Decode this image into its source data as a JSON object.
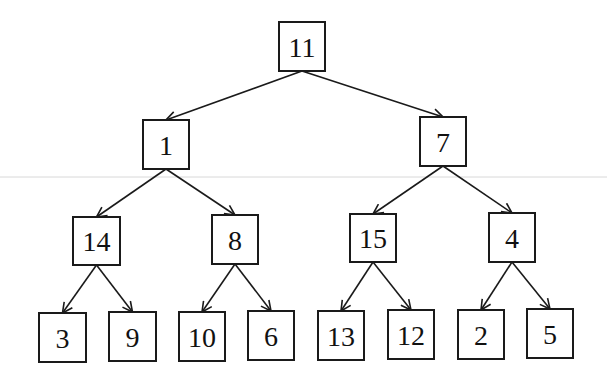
{
  "diagram": {
    "type": "binary-tree",
    "colors": {
      "stroke": "#1a1a1a",
      "fill": "#ffffff",
      "text": "#111111",
      "rule": "#d8d8d8"
    },
    "rule_y": 177,
    "nodes": [
      {
        "id": "n11",
        "label": "11",
        "x": 279,
        "y": 22,
        "w": 46,
        "h": 49
      },
      {
        "id": "n1",
        "label": "1",
        "x": 143,
        "y": 120,
        "w": 46,
        "h": 49
      },
      {
        "id": "n7",
        "label": "7",
        "x": 420,
        "y": 117,
        "w": 46,
        "h": 49
      },
      {
        "id": "n14",
        "label": "14",
        "x": 73,
        "y": 217,
        "w": 47,
        "h": 48
      },
      {
        "id": "n8",
        "label": "8",
        "x": 212,
        "y": 215,
        "w": 46,
        "h": 49
      },
      {
        "id": "n15",
        "label": "15",
        "x": 350,
        "y": 214,
        "w": 46,
        "h": 48
      },
      {
        "id": "n4",
        "label": "4",
        "x": 489,
        "y": 213,
        "w": 46,
        "h": 49
      },
      {
        "id": "n3",
        "label": "3",
        "x": 39,
        "y": 313,
        "w": 47,
        "h": 49
      },
      {
        "id": "n9",
        "label": "9",
        "x": 109,
        "y": 312,
        "w": 47,
        "h": 49
      },
      {
        "id": "n10",
        "label": "10",
        "x": 179,
        "y": 312,
        "w": 46,
        "h": 49
      },
      {
        "id": "n6",
        "label": "6",
        "x": 248,
        "y": 311,
        "w": 46,
        "h": 49
      },
      {
        "id": "n13",
        "label": "13",
        "x": 318,
        "y": 311,
        "w": 46,
        "h": 49
      },
      {
        "id": "n12",
        "label": "12",
        "x": 388,
        "y": 310,
        "w": 46,
        "h": 49
      },
      {
        "id": "n2",
        "label": "2",
        "x": 458,
        "y": 310,
        "w": 46,
        "h": 49
      },
      {
        "id": "n5",
        "label": "5",
        "x": 527,
        "y": 309,
        "w": 46,
        "h": 49
      }
    ],
    "edges": [
      {
        "from": "n11",
        "to": "n1"
      },
      {
        "from": "n11",
        "to": "n7"
      },
      {
        "from": "n1",
        "to": "n14"
      },
      {
        "from": "n1",
        "to": "n8"
      },
      {
        "from": "n7",
        "to": "n15"
      },
      {
        "from": "n7",
        "to": "n4"
      },
      {
        "from": "n14",
        "to": "n3"
      },
      {
        "from": "n14",
        "to": "n9"
      },
      {
        "from": "n8",
        "to": "n10"
      },
      {
        "from": "n8",
        "to": "n6"
      },
      {
        "from": "n15",
        "to": "n13"
      },
      {
        "from": "n15",
        "to": "n12"
      },
      {
        "from": "n4",
        "to": "n2"
      },
      {
        "from": "n4",
        "to": "n5"
      }
    ]
  }
}
